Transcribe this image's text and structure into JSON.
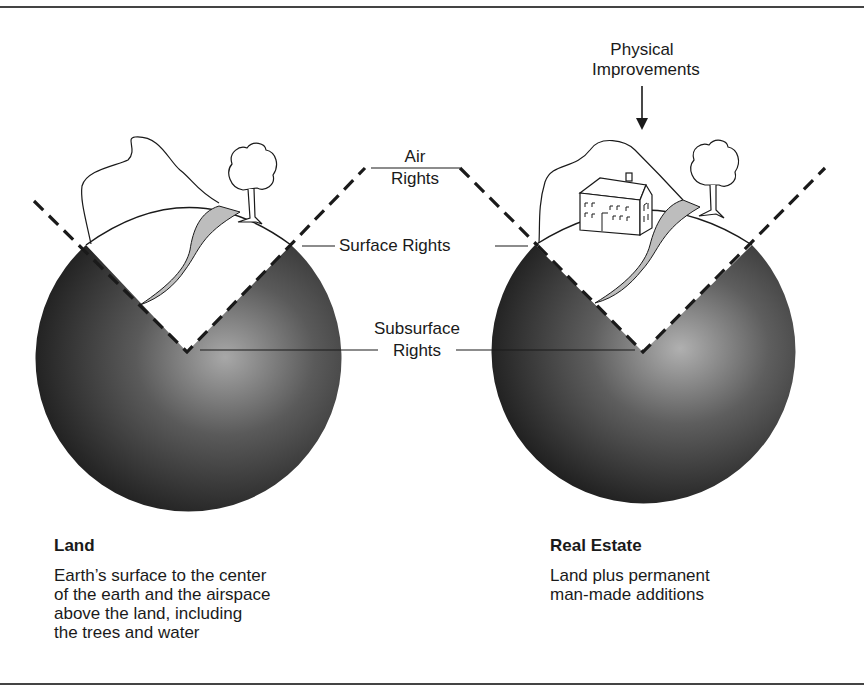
{
  "diagram": {
    "labels": {
      "physical_improvements": [
        "Physical",
        "Improvements"
      ],
      "air_rights": [
        "Air",
        "Rights"
      ],
      "surface_rights": "Surface Rights",
      "subsurface_rights": [
        "Subsurface",
        "Rights"
      ]
    },
    "left": {
      "title": "Land",
      "description": [
        "Earth’s surface to the center",
        "of the earth and the airspace",
        "above the land, including",
        "the trees and water"
      ]
    },
    "right": {
      "title": "Real Estate",
      "description": [
        "Land plus permanent",
        "man-made additions"
      ]
    },
    "colors": {
      "sphere_dark": "#1c1c1c",
      "sphere_light": "#9a9a9a",
      "water": "#bdbdbd",
      "line": "#1a1a1a"
    }
  }
}
